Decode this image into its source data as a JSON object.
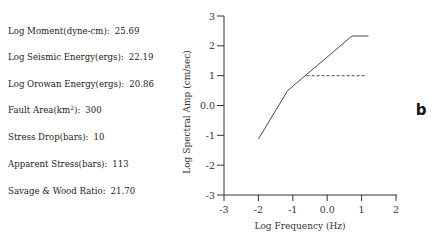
{
  "parameters": [
    {
      "label": "Log Moment(dyne-cm):",
      "value": "25.69",
      "y": 31
    },
    {
      "label": "Log Seismic Energy(ergs):",
      "value": "22.19",
      "y": 57
    },
    {
      "label": "Log Orowan Energy(ergs):",
      "value": "20.86",
      "y": 84
    },
    {
      "label": "Fault Area(km",
      "sup": "2",
      "label_suffix": "):",
      "value": "300",
      "y": 110
    },
    {
      "label": "Stress Drop(bars):",
      "value": "10",
      "y": 137
    },
    {
      "label": "Apparent Stress(bars):",
      "value": "113",
      "y": 164
    },
    {
      "label": "Savage & Wood Ratio:",
      "value": "21.70",
      "y": 191
    }
  ],
  "panel_label": "b",
  "colors": {
    "axis": "#333333",
    "line": "#4a4a4a",
    "background": "#ffffff"
  },
  "chart_data": {
    "type": "line",
    "title": "",
    "xlabel": "Log Frequency (Hz)",
    "ylabel": "Log Spectral Amp (cm/sec)",
    "xlim": [
      -3,
      2
    ],
    "ylim": [
      -3,
      3
    ],
    "xticks": [
      -3,
      -2,
      -1,
      0,
      1,
      2
    ],
    "xtick_labels": [
      "-3",
      "-2",
      "-1",
      "0.0",
      "1",
      "2"
    ],
    "yticks": [
      -3,
      -2,
      -1,
      0,
      1,
      2,
      3
    ],
    "ytick_labels": [
      "-3",
      "-2",
      "-1",
      "0.0",
      "1",
      "2",
      "3"
    ],
    "grid": false,
    "legend": null,
    "series": [
      {
        "name": "source spectrum",
        "style": "solid",
        "x": [
          -2.0,
          -1.15,
          0.72,
          1.2
        ],
        "y": [
          -1.13,
          0.5,
          2.33,
          2.33
        ]
      },
      {
        "name": "reference level",
        "style": "dashed",
        "x": [
          -0.6,
          1.15
        ],
        "y": [
          1.0,
          1.0
        ]
      }
    ]
  }
}
